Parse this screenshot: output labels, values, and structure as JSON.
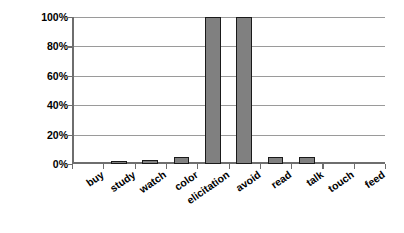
{
  "chart_data": {
    "type": "bar",
    "title": "",
    "subtitle": "",
    "xlabel": "",
    "ylabel": "Probability of Response",
    "categories": [
      "buy",
      "study",
      "watch",
      "color",
      "elicitation",
      "avoid",
      "read",
      "talk",
      "touch",
      "feed"
    ],
    "values": [
      0,
      1,
      3,
      5,
      100,
      100,
      5,
      5,
      0,
      0
    ],
    "ylim": [
      0,
      100
    ],
    "ytick_values": [
      0,
      20,
      40,
      60,
      80,
      100
    ],
    "ytick_labels": [
      "0%",
      "20%",
      "40%",
      "60%",
      "80%",
      "100%"
    ],
    "grid": "horizontal",
    "legend": "none",
    "series": [
      {
        "name": "Probability of Response",
        "values": [
          0,
          1,
          3,
          5,
          100,
          100,
          5,
          5,
          0,
          0
        ]
      }
    ],
    "colors": {
      "bar_fill": "#808080",
      "bar_border": "#1a1a1a",
      "gridline": "#9a9a9a",
      "axis": "#6e6e6e",
      "text": "#000000",
      "background": "#ffffff"
    }
  }
}
